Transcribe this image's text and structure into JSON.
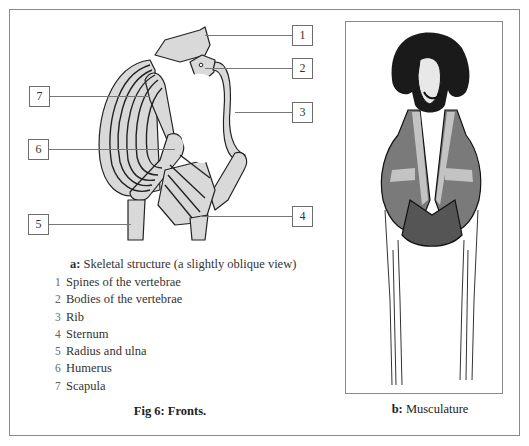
{
  "figure": {
    "title": "Fig 6: Fronts.",
    "panel_a": {
      "caption_prefix": "a:",
      "caption_text": " Skeletal structure (a slightly oblique view)",
      "callouts": [
        "1",
        "2",
        "3",
        "4",
        "5",
        "6",
        "7"
      ],
      "legend": [
        {
          "num": "1",
          "label": "Spines of the vertebrae"
        },
        {
          "num": "2",
          "label": "Bodies of the vertebrae"
        },
        {
          "num": "3",
          "label": "Rib"
        },
        {
          "num": "4",
          "label": "Sternum"
        },
        {
          "num": "5",
          "label": "Radius and ulna"
        },
        {
          "num": "6",
          "label": "Humerus"
        },
        {
          "num": "7",
          "label": "Scapula"
        }
      ]
    },
    "panel_b": {
      "caption_prefix": "b:",
      "caption_text": " Musculature"
    },
    "colors": {
      "bone_fill": "#d9d9d9",
      "outline": "#222222",
      "frame": "#8a8a8a"
    }
  }
}
